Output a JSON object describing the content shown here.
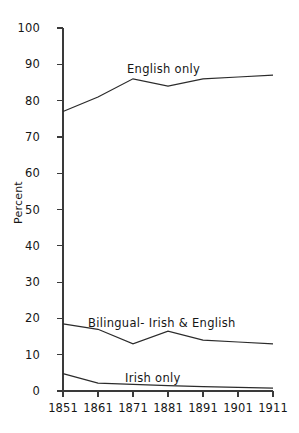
{
  "chart_data": {
    "type": "line",
    "title": "",
    "xlabel": "",
    "ylabel": "Percent",
    "x": [
      1851,
      1861,
      1871,
      1881,
      1891,
      1901,
      1911
    ],
    "xtick_labels": [
      "1851",
      "1861",
      "1871",
      "1881",
      "1891",
      "1901",
      "1911"
    ],
    "ytick_labels": [
      "0",
      "10",
      "20",
      "30",
      "40",
      "50",
      "60",
      "70",
      "80",
      "90",
      "100"
    ],
    "ytick_values": [
      0,
      10,
      20,
      30,
      40,
      50,
      60,
      70,
      80,
      90,
      100
    ],
    "ylim": [
      0,
      100
    ],
    "xlim": [
      1851,
      1911
    ],
    "grid": false,
    "legend": "inline-labels",
    "line_color": "#2b2b2b",
    "axis_color": "#3a3a3a",
    "series": [
      {
        "name": "English only",
        "label": "English only",
        "values": [
          77,
          81,
          86,
          84,
          86,
          86.5,
          87
        ]
      },
      {
        "name": "Bilingual- Irish & English",
        "label": "Bilingual- Irish & English",
        "values": [
          18.5,
          17,
          13,
          16.5,
          14,
          13.5,
          13
        ]
      },
      {
        "name": "Irish only",
        "label": "Irish only",
        "values": [
          4.8,
          2.2,
          1.8,
          1.5,
          1.2,
          1.0,
          0.8
        ]
      }
    ]
  },
  "figure": {
    "cropped_top_text": ""
  }
}
